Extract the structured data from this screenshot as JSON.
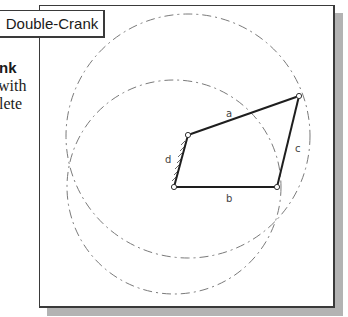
{
  "title_box": {
    "label": "Double-Crank"
  },
  "side_text": {
    "heading_fragment": "nk",
    "line1_fragment": "with",
    "line2_fragment": "lete"
  },
  "diagram": {
    "type": "four-bar linkage",
    "colors": {
      "link": "#1e1e1e",
      "circle": "#7a7a7a",
      "frame_border": "#3a3a3a",
      "shadow": "#b3b3b3"
    },
    "joints": [
      {
        "id": "ground_left",
        "x": 174,
        "y": 187
      },
      {
        "id": "crank_top",
        "x": 188,
        "y": 135
      },
      {
        "id": "coupler_end",
        "x": 299,
        "y": 96
      },
      {
        "id": "ground_right",
        "x": 277,
        "y": 187
      }
    ],
    "links": [
      {
        "label": "a",
        "from": "crank_top",
        "to": "coupler_end",
        "label_x": 229,
        "label_y": 117
      },
      {
        "label": "b",
        "from": "ground_left",
        "to": "ground_right",
        "label_x": 229,
        "label_y": 202
      },
      {
        "label": "c",
        "from": "coupler_end",
        "to": "ground_right",
        "label_x": 296,
        "label_y": 152
      },
      {
        "label": "d",
        "from": "ground_left",
        "to": "crank_top",
        "label_x": 166,
        "label_y": 163
      }
    ],
    "circles": [
      {
        "name": "path-circle-upper",
        "cx": 188,
        "cy": 136,
        "r": 122
      },
      {
        "name": "path-circle-lower",
        "cx": 174,
        "cy": 187,
        "r": 107
      }
    ]
  }
}
